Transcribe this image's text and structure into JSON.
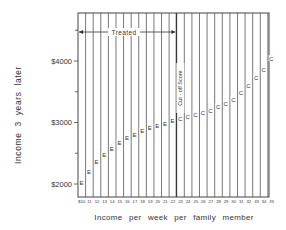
{
  "chart_data": {
    "type": "scatter",
    "title": "",
    "xlabel": "Income per week per family member",
    "ylabel": "Income 3 years later",
    "x_ticks": [
      10,
      11,
      12,
      13,
      14,
      15,
      16,
      17,
      18,
      19,
      20,
      21,
      22,
      23,
      24,
      25,
      26,
      27,
      28,
      29,
      30,
      31,
      32,
      33,
      34,
      35
    ],
    "x_tick_labels": [
      "$10",
      "11",
      "12",
      "13",
      "14",
      "15",
      "16",
      "17",
      "18",
      "19",
      "20",
      "21",
      "22",
      "23",
      "24",
      "25",
      "26",
      "27",
      "28",
      "29",
      "30",
      "31",
      "32",
      "33",
      "34",
      "35"
    ],
    "y_ticks": [
      2000,
      3000,
      4000
    ],
    "y_tick_labels": [
      "$2000",
      "$3000",
      "$4000"
    ],
    "y_minor_ticks": [
      2500,
      3500,
      4500
    ],
    "ylim": [
      1800,
      4800
    ],
    "xlim": [
      10,
      35
    ],
    "grid": "vertical lines at each x tick",
    "legend": "none (point markers are letters)",
    "series": [
      {
        "name": "E",
        "marker": "E",
        "group": "Treated (experimental)",
        "x": [
          10,
          11,
          12,
          13,
          14,
          15,
          16,
          17,
          18,
          19,
          20,
          21,
          22
        ],
        "values": [
          2015,
          2195,
          2360,
          2470,
          2570,
          2670,
          2750,
          2800,
          2860,
          2910,
          2945,
          2975,
          3020
        ]
      },
      {
        "name": "C",
        "marker": "C",
        "group": "Control",
        "x": [
          23,
          24,
          25,
          26,
          27,
          28,
          29,
          30,
          31,
          32,
          33,
          34,
          35
        ],
        "values": [
          3055,
          3090,
          3120,
          3155,
          3185,
          3250,
          3300,
          3365,
          3480,
          3590,
          3720,
          3855,
          4030
        ]
      }
    ],
    "annotations": [
      {
        "text": "Treated",
        "type": "double-arrow",
        "x_from": 10,
        "x_to": 22.7,
        "y": 4600
      },
      {
        "text": "Cut-off Score",
        "type": "vertical-line-label",
        "x": 22.7,
        "orientation": "rotated-90"
      }
    ]
  },
  "labels": {
    "ylabel": "Income  3  years  later",
    "xlabel": "Income  per  week  per  family  member",
    "treated": "Treated",
    "cutoff": "Cut - off  Score"
  }
}
